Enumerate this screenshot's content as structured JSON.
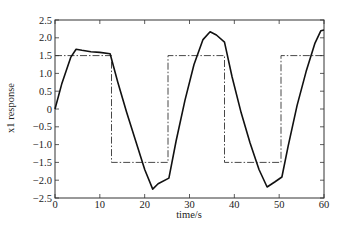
{
  "chart_data": {
    "type": "line",
    "title": "",
    "xlabel": "time/s",
    "ylabel": "x1 response",
    "xlim": [
      0,
      60
    ],
    "ylim": [
      -2.5,
      2.5
    ],
    "xticks": [
      0,
      10,
      20,
      30,
      40,
      50,
      60
    ],
    "xtick_labels": [
      "0",
      "10",
      "20",
      "30",
      "40",
      "50",
      "60"
    ],
    "yticks": [
      2.5,
      2.0,
      1.5,
      1.0,
      0.5,
      0,
      -0.5,
      -1.0,
      -1.5,
      -2.0,
      -2.5
    ],
    "ytick_labels": [
      "2.5",
      "2.0",
      "1.5",
      "1.0",
      "0.5",
      "0",
      "−0.5",
      "−1.0",
      "−1.5",
      "−2.0",
      "−2.5"
    ],
    "grid": false,
    "legend": null,
    "series": [
      {
        "name": "x1 response",
        "style": "solid",
        "color": "#111111",
        "x": [
          0,
          1.5,
          3.5,
          4.7,
          6,
          8,
          10,
          12.3,
          14,
          16,
          18,
          20,
          21.8,
          23,
          25.4,
          27,
          29,
          31,
          33,
          34.6,
          36,
          37.8,
          39.5,
          41.5,
          43.5,
          45.5,
          47.3,
          49,
          50.6,
          52,
          54,
          56,
          58,
          59.3,
          60
        ],
        "y": [
          0,
          0.7,
          1.45,
          1.68,
          1.65,
          1.61,
          1.59,
          1.55,
          0.75,
          -0.1,
          -0.9,
          -1.7,
          -2.25,
          -2.1,
          -1.94,
          -0.9,
          0.25,
          1.25,
          1.95,
          2.17,
          2.08,
          1.88,
          0.9,
          -0.1,
          -0.95,
          -1.7,
          -2.19,
          -2.05,
          -1.91,
          -1.05,
          0.1,
          1.05,
          1.85,
          2.2,
          2.22
        ]
      },
      {
        "name": "reference (square wave)",
        "style": "dash-dot",
        "color": "#333333",
        "x": [
          0,
          12.6,
          12.6,
          25.2,
          25.2,
          37.8,
          37.8,
          50.4,
          50.4,
          60
        ],
        "y": [
          1.5,
          1.5,
          -1.5,
          -1.5,
          1.5,
          1.5,
          -1.5,
          -1.5,
          1.5,
          1.5
        ]
      }
    ]
  }
}
